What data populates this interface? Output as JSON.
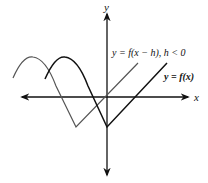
{
  "figure": {
    "axes": {
      "x_label": "x",
      "y_label": "y"
    },
    "curves": [
      {
        "id": "original",
        "label": "y = f(x)",
        "color": "#111111"
      },
      {
        "id": "shifted",
        "label": "y = f(x − h), h < 0",
        "color": "#555555"
      }
    ],
    "labels": {
      "original": "y = f(x)",
      "shifted": "y = f(x − h), h < 0"
    }
  }
}
